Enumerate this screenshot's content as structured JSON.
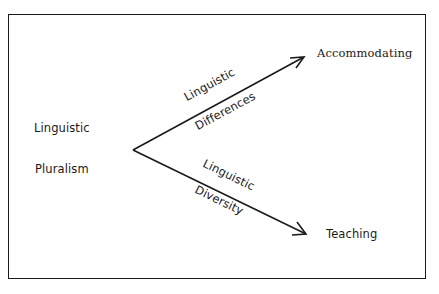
{
  "diagram": {
    "source": {
      "line1": "Linguistic",
      "line2": "Pluralism"
    },
    "branches": [
      {
        "target": "Accommodating",
        "label_above": "Linguistic",
        "label_below": "Differences"
      },
      {
        "target": "Teaching",
        "label_above": "Linguistic",
        "label_below": "Diversity"
      }
    ]
  },
  "colors": {
    "ink": "#1a1a1a",
    "background": "#ffffff"
  }
}
